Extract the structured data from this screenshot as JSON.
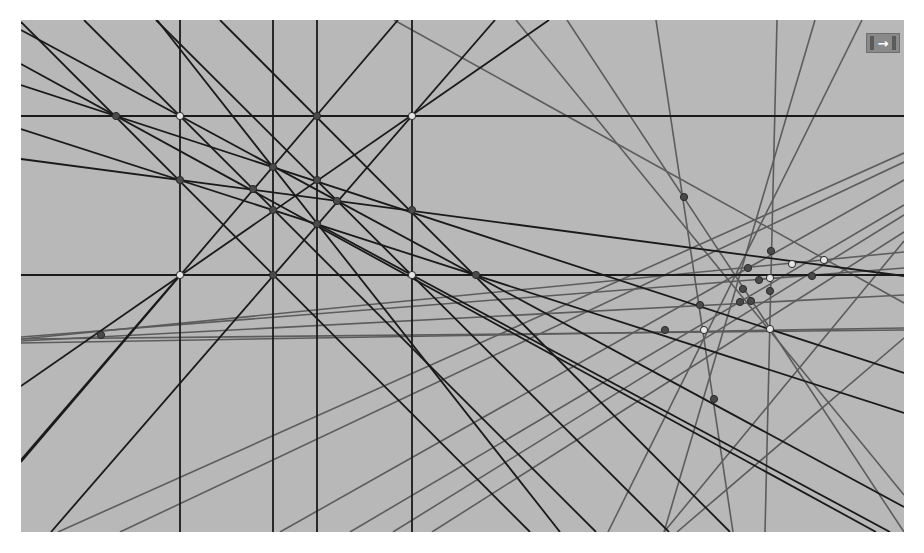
{
  "canvas": {
    "background": "#b8b8b8",
    "origin": [
      21,
      20
    ],
    "width": 883,
    "height": 512,
    "black_color": "#1a1a1a",
    "gray_color": "#5c5c5c",
    "point_dark_fill": "#4a4a4a",
    "point_light_fill": "#e6e6e6"
  },
  "toolbar": {
    "export_icon": "arrow-right-icon",
    "export_glyph": "→"
  },
  "black_lines": [
    [
      180,
      20,
      180,
      532
    ],
    [
      273,
      20,
      273,
      532
    ],
    [
      317,
      20,
      317,
      532
    ],
    [
      412,
      20,
      412,
      532
    ],
    [
      21,
      116,
      904,
      116
    ],
    [
      21,
      275,
      904,
      275
    ],
    [
      21,
      22,
      530,
      532
    ],
    [
      21,
      64,
      876,
      532
    ],
    [
      21,
      85,
      904,
      373
    ],
    [
      21,
      30,
      904,
      507
    ],
    [
      21,
      159,
      904,
      276
    ],
    [
      21,
      129,
      904,
      413
    ],
    [
      21,
      386,
      549,
      20
    ],
    [
      21,
      462,
      398,
      20
    ],
    [
      51,
      532,
      495,
      20
    ],
    [
      84,
      20,
      596,
      532
    ],
    [
      157,
      20,
      560,
      532
    ],
    [
      220,
      20,
      730,
      532
    ],
    [
      156,
      20,
      669,
      532
    ],
    [
      317,
      224,
      890,
      532
    ],
    [
      21,
      460,
      180,
      275
    ]
  ],
  "gray_lines": [
    [
      394,
      20,
      904,
      303
    ],
    [
      516,
      20,
      904,
      495
    ],
    [
      567,
      20,
      904,
      532
    ],
    [
      656,
      20,
      733,
      532
    ],
    [
      777,
      20,
      765,
      532
    ],
    [
      815,
      20,
      664,
      532
    ],
    [
      862,
      20,
      608,
      532
    ],
    [
      21,
      339,
      904,
      252
    ],
    [
      21,
      341,
      904,
      295
    ],
    [
      21,
      337,
      904,
      268
    ],
    [
      21,
      343,
      904,
      328
    ],
    [
      58,
      532,
      904,
      153
    ],
    [
      120,
      532,
      904,
      162
    ],
    [
      280,
      532,
      904,
      180
    ],
    [
      350,
      532,
      904,
      205
    ],
    [
      393,
      532,
      904,
      215
    ],
    [
      432,
      532,
      904,
      232
    ],
    [
      664,
      532,
      904,
      241
    ],
    [
      677,
      532,
      904,
      338
    ],
    [
      21,
      339,
      904,
      330
    ]
  ],
  "points": [
    {
      "x": 116,
      "y": 116,
      "type": "dark"
    },
    {
      "x": 180,
      "y": 116,
      "type": "light"
    },
    {
      "x": 317,
      "y": 116,
      "type": "dark"
    },
    {
      "x": 412,
      "y": 116,
      "type": "light"
    },
    {
      "x": 273,
      "y": 167,
      "type": "dark"
    },
    {
      "x": 180,
      "y": 180,
      "type": "dark"
    },
    {
      "x": 317,
      "y": 180,
      "type": "dark"
    },
    {
      "x": 253,
      "y": 189,
      "type": "dark"
    },
    {
      "x": 337,
      "y": 201,
      "type": "dark"
    },
    {
      "x": 273,
      "y": 210,
      "type": "dark"
    },
    {
      "x": 412,
      "y": 210,
      "type": "dark"
    },
    {
      "x": 317,
      "y": 224,
      "type": "dark"
    },
    {
      "x": 180,
      "y": 275,
      "type": "light"
    },
    {
      "x": 273,
      "y": 275,
      "type": "dark"
    },
    {
      "x": 412,
      "y": 275,
      "type": "light"
    },
    {
      "x": 476,
      "y": 275,
      "type": "dark"
    },
    {
      "x": 101,
      "y": 335,
      "type": "dark"
    },
    {
      "x": 684,
      "y": 197,
      "type": "dark"
    },
    {
      "x": 771,
      "y": 251,
      "type": "dark"
    },
    {
      "x": 748,
      "y": 268,
      "type": "dark"
    },
    {
      "x": 759,
      "y": 280,
      "type": "dark"
    },
    {
      "x": 743,
      "y": 289,
      "type": "dark"
    },
    {
      "x": 740,
      "y": 302,
      "type": "dark"
    },
    {
      "x": 751,
      "y": 301,
      "type": "dark"
    },
    {
      "x": 770,
      "y": 291,
      "type": "dark"
    },
    {
      "x": 700,
      "y": 305,
      "type": "dark"
    },
    {
      "x": 665,
      "y": 330,
      "type": "dark"
    },
    {
      "x": 812,
      "y": 276,
      "type": "dark"
    },
    {
      "x": 714,
      "y": 399,
      "type": "dark"
    },
    {
      "x": 792,
      "y": 264,
      "type": "light"
    },
    {
      "x": 824,
      "y": 260,
      "type": "light"
    },
    {
      "x": 770,
      "y": 278,
      "type": "light"
    },
    {
      "x": 704,
      "y": 330,
      "type": "light"
    },
    {
      "x": 770,
      "y": 329,
      "type": "light"
    }
  ]
}
